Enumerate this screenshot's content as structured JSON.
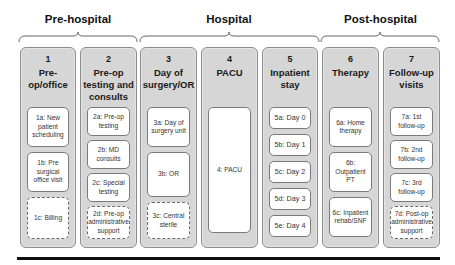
{
  "phases": [
    {
      "label": "Pre-hospital"
    },
    {
      "label": "Hospital"
    },
    {
      "label": "Post-hospital"
    }
  ],
  "columns": [
    {
      "number": "1",
      "title": "Pre-op/office",
      "items": [
        {
          "label": "1a: New patient scheduling",
          "style": "solid"
        },
        {
          "label": "1b: Pre surgical office visit",
          "style": "solid"
        },
        {
          "label": "1c: Billing",
          "style": "dashed"
        }
      ]
    },
    {
      "number": "2",
      "title": "Pre-op testing and consults",
      "items": [
        {
          "label": "2a: Pre-op testing",
          "style": "solid"
        },
        {
          "label": "2b: MD consults",
          "style": "solid"
        },
        {
          "label": "2c: Special testing",
          "style": "solid"
        },
        {
          "label": "2d: Pre-op administrative support",
          "style": "dashed"
        }
      ]
    },
    {
      "number": "3",
      "title": "Day of surgery/OR",
      "items": [
        {
          "label": "3a: Day of surgery unit",
          "style": "solid"
        },
        {
          "label": "3b: OR",
          "style": "solid"
        },
        {
          "label": "3c: Central sterile",
          "style": "dashed"
        }
      ]
    },
    {
      "number": "4",
      "title": "PACU",
      "items": [
        {
          "label": "4: PACU",
          "style": "solid"
        }
      ]
    },
    {
      "number": "5",
      "title": "Inpatient stay",
      "items": [
        {
          "label": "5a: Day 0",
          "style": "solid"
        },
        {
          "label": "5b: Day 1",
          "style": "solid"
        },
        {
          "label": "5c: Day 2",
          "style": "solid"
        },
        {
          "label": "5d: Day 3",
          "style": "solid"
        },
        {
          "label": "5e: Day 4",
          "style": "solid"
        }
      ]
    },
    {
      "number": "6",
      "title": "Therapy",
      "items": [
        {
          "label": "6a: Home therapy",
          "style": "solid"
        },
        {
          "label": "6b: Outpatient PT",
          "style": "solid"
        },
        {
          "label": "6c: Inpatient rehab/SNF",
          "style": "solid"
        }
      ]
    },
    {
      "number": "7",
      "title": "Follow-up visits",
      "items": [
        {
          "label": "7a: 1st follow-up",
          "style": "solid"
        },
        {
          "label": "7b: 2nd follow-up",
          "style": "solid"
        },
        {
          "label": "7c: 3rd follow-up",
          "style": "solid"
        },
        {
          "label": "7d: Post-op administrative support",
          "style": "dashed"
        }
      ]
    }
  ],
  "colors": {
    "column_fill": "#d6d6d6",
    "box_fill": "#ffffff",
    "bottom_line": "#111111"
  }
}
